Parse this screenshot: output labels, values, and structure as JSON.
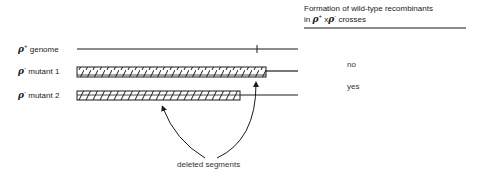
{
  "header": {
    "line1": "Formation of wild-type recombinants",
    "line2_prefix": "in ",
    "rho1": "ρ",
    "sup1": "+",
    "times": " x",
    "rho2": "ρ",
    "sup2": "-",
    "line2_suffix": " crosses"
  },
  "rows": [
    {
      "symbol": "ρ",
      "sup": "+",
      "label": "genome",
      "answer": ""
    },
    {
      "symbol": "ρ",
      "sup": "-",
      "label": "mutant 1",
      "answer": "no"
    },
    {
      "symbol": "ρ",
      "sup": "-",
      "label": "mutant 2",
      "answer": "yes"
    }
  ],
  "annotation": "deleted segments",
  "colors": {
    "ink": "#1a1a1a",
    "background": "#ffffff"
  }
}
